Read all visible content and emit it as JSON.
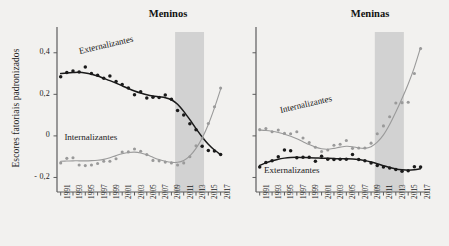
{
  "figure": {
    "ylabel": "Escores fatoriais padronizados",
    "background": "#f2f1ef",
    "panels": [
      {
        "key": "meninos",
        "title": "Meninos"
      },
      {
        "key": "meninas",
        "title": "Meninas"
      }
    ]
  },
  "chart_data": {
    "type": "scatter",
    "title": "",
    "xlabel": "",
    "ylabel": "Escores fatoriais padronizados",
    "ylim": [
      -0.27,
      0.5
    ],
    "xlim": [
      1990.4,
      2018.2
    ],
    "grid": false,
    "legend": "inline-annotations",
    "yticks": [
      0.4,
      0.2,
      0,
      -0.2
    ],
    "yticklabels": [
      "0,4",
      "0,2",
      "0",
      "- 0,2"
    ],
    "xticks": [
      1991,
      1993,
      1995,
      1997,
      1999,
      2001,
      2003,
      2005,
      2007,
      2009,
      2011,
      2013,
      2015,
      2017
    ],
    "xticklabels": [
      "1991",
      "1993",
      "1995",
      "1997",
      "1999",
      "2001",
      "2003",
      "2005",
      "2007",
      "2009",
      "2011",
      "2013",
      "2015",
      "2017"
    ],
    "shaded_band": {
      "start": 2009.6,
      "end": 2014.3,
      "color": "#c9c9c9"
    },
    "colors": {
      "externalizantes": "#1a1a1a",
      "internalizantes": "#9a9a9a"
    },
    "panels": [
      {
        "name": "Meninos",
        "series": [
          {
            "name": "Externalizantes",
            "color": "#1a1a1a",
            "label_position": {
              "x": 1994.0,
              "y": 0.4
            },
            "label_rotation": -13,
            "x": [
              1991,
              1992,
              1993,
              1994,
              1995,
              1996,
              1997,
              1998,
              1999,
              2000,
              2001,
              2002,
              2003,
              2004,
              2005,
              2006,
              2007,
              2008,
              2009,
              2010,
              2011,
              2012,
              2013,
              2014,
              2015,
              2016,
              2017
            ],
            "y": [
              0.285,
              0.305,
              0.312,
              0.308,
              0.332,
              0.3,
              0.292,
              0.277,
              0.288,
              0.262,
              0.247,
              0.23,
              0.198,
              0.213,
              0.182,
              0.186,
              0.185,
              0.197,
              0.176,
              0.122,
              0.1,
              0.058,
              0.03,
              -0.05,
              -0.07,
              -0.073,
              -0.09
            ],
            "fit": [
              0.3,
              0.303,
              0.305,
              0.306,
              0.303,
              0.297,
              0.288,
              0.277,
              0.266,
              0.254,
              0.241,
              0.228,
              0.216,
              0.206,
              0.198,
              0.192,
              0.188,
              0.184,
              0.174,
              0.152,
              0.118,
              0.078,
              0.035,
              -0.005,
              -0.04,
              -0.068,
              -0.09
            ]
          },
          {
            "name": "Internalizantes",
            "color": "#9a9a9a",
            "label_position": {
              "x": 1991.6,
              "y": -0.015
            },
            "label_rotation": 0,
            "x": [
              1991,
              1992,
              1993,
              1994,
              1995,
              1996,
              1997,
              1998,
              1999,
              2000,
              2001,
              2002,
              2003,
              2004,
              2005,
              2006,
              2007,
              2008,
              2009,
              2010,
              2011,
              2012,
              2013,
              2014,
              2015,
              2016,
              2017
            ],
            "y": [
              -0.13,
              -0.108,
              -0.105,
              -0.14,
              -0.143,
              -0.14,
              -0.133,
              -0.122,
              -0.122,
              -0.11,
              -0.078,
              -0.077,
              -0.063,
              -0.074,
              -0.09,
              -0.118,
              -0.12,
              -0.126,
              -0.13,
              -0.14,
              -0.13,
              -0.1,
              -0.048,
              -0.01,
              0.06,
              0.14,
              0.23
            ],
            "fit": [
              -0.122,
              -0.121,
              -0.12,
              -0.12,
              -0.12,
              -0.119,
              -0.117,
              -0.113,
              -0.105,
              -0.095,
              -0.086,
              -0.08,
              -0.078,
              -0.082,
              -0.091,
              -0.103,
              -0.114,
              -0.122,
              -0.127,
              -0.127,
              -0.118,
              -0.096,
              -0.06,
              -0.01,
              0.055,
              0.135,
              0.225
            ]
          }
        ]
      },
      {
        "name": "Meninas",
        "series": [
          {
            "name": "Internalizantes",
            "color": "#9a9a9a",
            "label_position": {
              "x": 1994.3,
              "y": 0.115
            },
            "label_rotation": -13,
            "x": [
              1991,
              1992,
              1993,
              1994,
              1995,
              1996,
              1997,
              1998,
              1999,
              2000,
              2001,
              2002,
              2003,
              2004,
              2005,
              2006,
              2007,
              2008,
              2009,
              2010,
              2011,
              2012,
              2013,
              2014,
              2015,
              2016,
              2017
            ],
            "y": [
              0.03,
              0.035,
              0.02,
              0.028,
              0.012,
              0.01,
              0.02,
              -0.01,
              -0.032,
              -0.055,
              -0.075,
              -0.068,
              -0.045,
              -0.04,
              -0.022,
              -0.06,
              -0.058,
              -0.058,
              -0.035,
              0.01,
              0.048,
              0.092,
              0.158,
              0.16,
              0.162,
              0.3,
              0.42
            ],
            "fit": [
              0.028,
              0.026,
              0.022,
              0.016,
              0.008,
              -0.002,
              -0.014,
              -0.028,
              -0.042,
              -0.054,
              -0.062,
              -0.064,
              -0.06,
              -0.054,
              -0.05,
              -0.052,
              -0.058,
              -0.06,
              -0.052,
              -0.03,
              0.005,
              0.055,
              0.115,
              0.18,
              0.25,
              0.33,
              0.425
            ]
          },
          {
            "name": "Externalizantes",
            "color": "#1a1a1a",
            "label_position": {
              "x": 1991.7,
              "y": -0.175
            },
            "label_rotation": 0,
            "x": [
              1991,
              1992,
              1993,
              1994,
              1995,
              1996,
              1997,
              1998,
              1999,
              2000,
              2001,
              2002,
              2003,
              2004,
              2005,
              2006,
              2007,
              2008,
              2009,
              2010,
              2011,
              2012,
              2013,
              2014,
              2015,
              2016,
              2017
            ],
            "y": [
              -0.15,
              -0.128,
              -0.12,
              -0.1,
              -0.068,
              -0.072,
              -0.105,
              -0.103,
              -0.103,
              -0.122,
              -0.098,
              -0.112,
              -0.113,
              -0.112,
              -0.112,
              -0.09,
              -0.113,
              -0.12,
              -0.13,
              -0.142,
              -0.15,
              -0.155,
              -0.162,
              -0.17,
              -0.168,
              -0.148,
              -0.15
            ],
            "fit": [
              -0.142,
              -0.13,
              -0.12,
              -0.112,
              -0.107,
              -0.104,
              -0.103,
              -0.104,
              -0.105,
              -0.106,
              -0.107,
              -0.108,
              -0.109,
              -0.11,
              -0.11,
              -0.111,
              -0.114,
              -0.119,
              -0.126,
              -0.134,
              -0.143,
              -0.152,
              -0.159,
              -0.163,
              -0.165,
              -0.163,
              -0.158
            ]
          }
        ]
      }
    ]
  }
}
